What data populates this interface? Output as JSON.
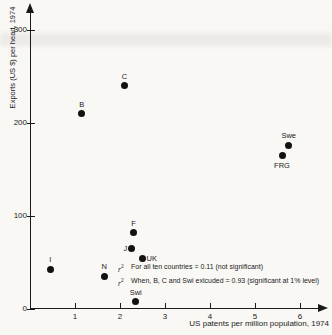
{
  "figure": {
    "ink_color": "#1a1a1a",
    "paper_color": "#f9f8f5",
    "point_color": "#121212"
  },
  "chart_data": {
    "type": "scatter",
    "title": "",
    "xlabel": "US patents per million population, 1974",
    "ylabel": "Exports (US $) per head, 1974",
    "xlim": [
      0,
      6.6
    ],
    "ylim": [
      0,
      320
    ],
    "x_ticks": [
      1,
      2,
      3,
      4,
      5,
      6
    ],
    "y_ticks": [
      0,
      100,
      200,
      300
    ],
    "grid": false,
    "legend": "none",
    "points": [
      {
        "label": "I",
        "x": 0.45,
        "y": 43,
        "label_pos": "above"
      },
      {
        "label": "B",
        "x": 1.15,
        "y": 210,
        "label_pos": "above"
      },
      {
        "label": "N",
        "x": 1.65,
        "y": 35,
        "label_pos": "above"
      },
      {
        "label": "C",
        "x": 2.1,
        "y": 240,
        "label_pos": "above"
      },
      {
        "label": "J",
        "x": 2.25,
        "y": 65,
        "label_pos": "left"
      },
      {
        "label": "F",
        "x": 2.3,
        "y": 82,
        "label_pos": "above"
      },
      {
        "label": "UK",
        "x": 2.5,
        "y": 54,
        "label_pos": "right"
      },
      {
        "label": "Swi",
        "x": 2.35,
        "y": 8,
        "label_pos": "above"
      },
      {
        "label": "FRG",
        "x": 5.6,
        "y": 165,
        "label_pos": "below"
      },
      {
        "label": "Swe",
        "x": 5.75,
        "y": 176,
        "label_pos": "above"
      }
    ],
    "annotations": [
      {
        "symbol": "r",
        "sup": "2",
        "text": "For all ten countries = 0.11 (not significant)"
      },
      {
        "symbol": "r",
        "sup": "2",
        "text": "When, B, C and Swi exlcuded = 0.93 (significant at 1% level)"
      }
    ]
  }
}
